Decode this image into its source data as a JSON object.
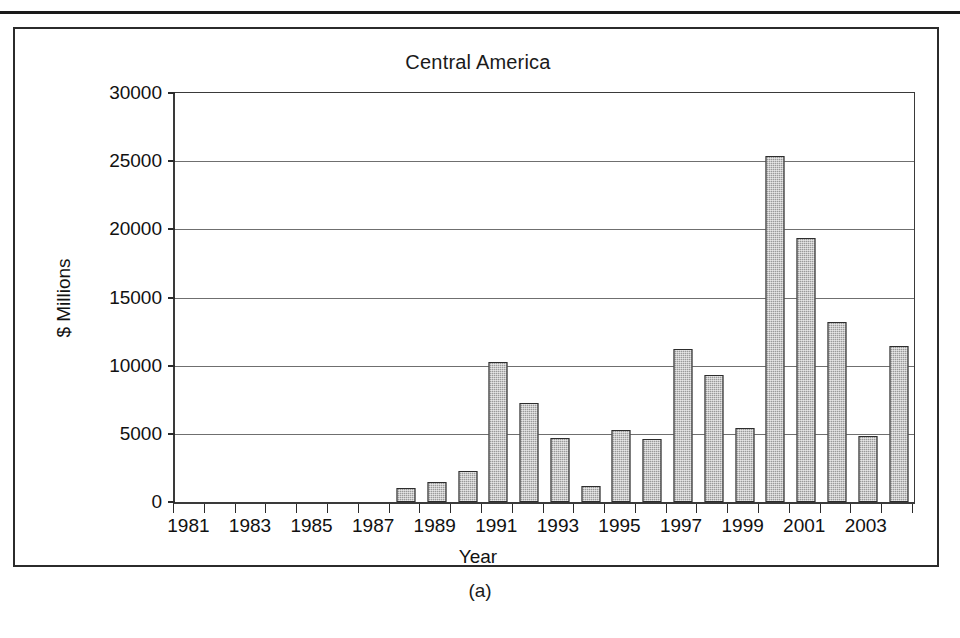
{
  "figure": {
    "caption": "(a)"
  },
  "chart_data": {
    "type": "bar",
    "title": "Central America",
    "xlabel": "Year",
    "ylabel": "$ Millions",
    "ylim": [
      0,
      30000
    ],
    "ytick_labels": [
      "0",
      "5000",
      "10000",
      "15000",
      "20000",
      "25000",
      "30000"
    ],
    "ytick_values": [
      0,
      5000,
      10000,
      15000,
      20000,
      25000,
      30000
    ],
    "xtick_labels": [
      "1981",
      "1983",
      "1985",
      "1987",
      "1989",
      "1991",
      "1993",
      "1995",
      "1997",
      "1999",
      "2001",
      "2003"
    ],
    "grid": "horizontal",
    "legend": "none",
    "bar_color": "#9a9a9a",
    "bar_edge_color": "#2d2d2d",
    "categories": [
      "1981",
      "1982",
      "1983",
      "1984",
      "1985",
      "1986",
      "1987",
      "1988",
      "1989",
      "1990",
      "1991",
      "1992",
      "1993",
      "1994",
      "1995",
      "1996",
      "1997",
      "1998",
      "1999",
      "2000",
      "2001",
      "2002",
      "2003",
      "2004"
    ],
    "values": [
      0,
      0,
      0,
      0,
      0,
      0,
      0,
      1000,
      1500,
      2300,
      10250,
      7250,
      4700,
      1200,
      5300,
      4650,
      11250,
      9350,
      5450,
      25400,
      19400,
      13200,
      4850,
      11450
    ]
  }
}
